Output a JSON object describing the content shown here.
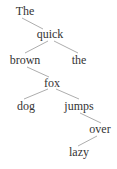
{
  "diagram": {
    "type": "tree",
    "background_color": "#ffffff",
    "text_color": "#343434",
    "edge_color": "#8a8a8a",
    "sentence": "The quick brown the fox dog jumps over lazy",
    "nodes": [
      {
        "id": "the1",
        "label": "The",
        "x": 25,
        "y": 5,
        "level": 0
      },
      {
        "id": "quick",
        "label": "quick",
        "x": 50,
        "y": 28,
        "level": 1
      },
      {
        "id": "brown",
        "label": "brown",
        "x": 25,
        "y": 54,
        "level": 2
      },
      {
        "id": "the2",
        "label": "the",
        "x": 79,
        "y": 54,
        "level": 2
      },
      {
        "id": "fox",
        "label": "fox",
        "x": 52,
        "y": 77,
        "level": 3
      },
      {
        "id": "dog",
        "label": "dog",
        "x": 26,
        "y": 100,
        "level": 4
      },
      {
        "id": "jumps",
        "label": "jumps",
        "x": 79,
        "y": 100,
        "level": 4
      },
      {
        "id": "over",
        "label": "over",
        "x": 100,
        "y": 123,
        "level": 5
      },
      {
        "id": "lazy",
        "label": "lazy",
        "x": 79,
        "y": 146,
        "level": 6
      }
    ],
    "edges": [
      {
        "from": "the1",
        "to": "quick",
        "x1": 22,
        "y1": 18,
        "x2": 43,
        "y2": 29
      },
      {
        "from": "quick",
        "to": "brown",
        "x1": 48,
        "y1": 41,
        "x2": 25,
        "y2": 53
      },
      {
        "from": "quick",
        "to": "the2",
        "x1": 54,
        "y1": 41,
        "x2": 78,
        "y2": 53
      },
      {
        "from": "brown",
        "to": "fox",
        "x1": 27,
        "y1": 67,
        "x2": 49,
        "y2": 77
      },
      {
        "from": "fox",
        "to": "dog",
        "x1": 48,
        "y1": 89,
        "x2": 24,
        "y2": 99
      },
      {
        "from": "fox",
        "to": "jumps",
        "x1": 56,
        "y1": 89,
        "x2": 79,
        "y2": 99
      },
      {
        "from": "jumps",
        "to": "over",
        "x1": 80,
        "y1": 113,
        "x2": 101,
        "y2": 123
      },
      {
        "from": "over",
        "to": "lazy",
        "x1": 97,
        "y1": 136,
        "x2": 78,
        "y2": 146
      }
    ]
  }
}
